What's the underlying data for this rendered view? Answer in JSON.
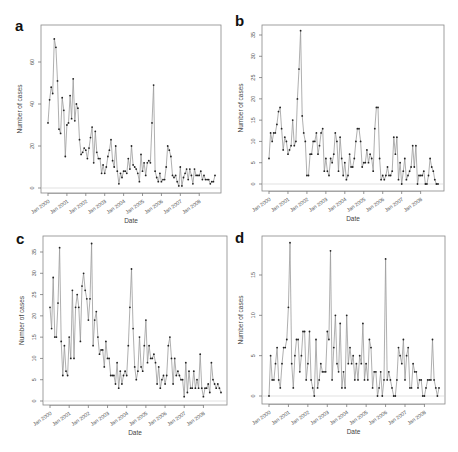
{
  "figure": {
    "panels": [
      "a",
      "b",
      "c",
      "d"
    ]
  },
  "chart_data": [
    {
      "panel": "a",
      "type": "line",
      "title": "",
      "xlabel": "Date",
      "ylabel": "Number of cases",
      "ylim": [
        0,
        75
      ],
      "yticks": [
        0,
        20,
        40,
        60
      ],
      "xticks": [
        "Jan 2000",
        "Jan 2001",
        "Jan 2002",
        "Jan 2003",
        "Jan 2004",
        "Jan 2005",
        "Jan 2006",
        "Jan 2007",
        "Jan 2008"
      ],
      "grid": false,
      "markers": true,
      "x_start": "Jan 2000",
      "frequency": "monthly",
      "values": [
        31,
        42,
        48,
        45,
        71,
        67,
        51,
        28,
        26,
        43,
        37,
        15,
        30,
        31,
        44,
        33,
        52,
        32,
        40,
        38,
        23,
        16,
        17,
        19,
        18,
        14,
        19,
        24,
        29,
        12,
        27,
        17,
        14,
        14,
        7,
        11,
        7,
        10,
        15,
        18,
        23,
        13,
        10,
        20,
        8,
        2,
        7,
        5,
        8,
        8,
        7,
        14,
        9,
        20,
        11,
        10,
        9,
        7,
        3,
        16,
        8,
        12,
        6,
        12,
        13,
        12,
        31,
        49,
        8,
        5,
        3,
        7,
        3,
        4,
        4,
        10,
        20,
        18,
        15,
        6,
        5,
        6,
        3,
        1,
        10,
        1,
        5,
        7,
        9,
        4,
        9,
        6,
        2,
        9,
        6,
        6,
        6,
        8,
        4,
        6,
        4,
        4,
        4,
        2,
        3,
        3,
        6
      ]
    },
    {
      "panel": "b",
      "type": "line",
      "title": "",
      "xlabel": "Date",
      "ylabel": "Number of cases",
      "ylim": [
        0,
        36
      ],
      "yticks": [
        0,
        5,
        10,
        15,
        20,
        25,
        30,
        35
      ],
      "xticks": [
        "Jan 2000",
        "Jan 2001",
        "Jan 2002",
        "Jan 2003",
        "Jan 2004",
        "Jan 2005",
        "Jan 2006",
        "Jan 2007",
        "Jan 2008"
      ],
      "grid": false,
      "markers": true,
      "x_start": "Jan 2000",
      "frequency": "monthly",
      "values": [
        6,
        12,
        10,
        12,
        12,
        14,
        17,
        18,
        13,
        8,
        11,
        10,
        7,
        8,
        9,
        15,
        9,
        10,
        20,
        27,
        36,
        16,
        12,
        10,
        2,
        2,
        7,
        7,
        10,
        10,
        12,
        7,
        9,
        12,
        13,
        3,
        6,
        3,
        2,
        6,
        5,
        7,
        12,
        10,
        3,
        11,
        6,
        2,
        5,
        1,
        2,
        7,
        4,
        4,
        6,
        10,
        13,
        13,
        10,
        4,
        5,
        5,
        8,
        5,
        7,
        6,
        3,
        13,
        18,
        18,
        6,
        1,
        2,
        1,
        2,
        4,
        2,
        2,
        3,
        11,
        7,
        11,
        1,
        5,
        0,
        3,
        6,
        1,
        2,
        3,
        4,
        9,
        4,
        9,
        0,
        2,
        2,
        2,
        3,
        0,
        0,
        2,
        6,
        4,
        3,
        1,
        0,
        0
      ]
    },
    {
      "panel": "c",
      "type": "line",
      "title": "",
      "xlabel": "Date",
      "ylabel": "Number of cases",
      "ylim": [
        0,
        37
      ],
      "yticks": [
        0,
        5,
        10,
        15,
        20,
        25,
        30,
        35
      ],
      "xticks": [
        "Jan 2000",
        "Jan 2001",
        "Jan 2002",
        "Jan 2003",
        "Jan 2004",
        "Jan 2005",
        "Jan 2006",
        "Jan 2007",
        "Jan 2008"
      ],
      "grid": false,
      "markers": true,
      "x_start": "Jan 2000",
      "frequency": "monthly",
      "values": [
        22,
        17,
        29,
        15,
        15,
        23,
        36,
        14,
        6,
        13,
        7,
        6,
        15,
        10,
        26,
        10,
        22,
        25,
        22,
        14,
        27,
        30,
        26,
        24,
        19,
        24,
        37,
        13,
        19,
        21,
        15,
        11,
        12,
        12,
        8,
        14,
        10,
        10,
        6,
        6,
        6,
        4,
        9,
        3,
        7,
        4,
        6,
        7,
        6,
        13,
        22,
        31,
        17,
        8,
        5,
        7,
        15,
        8,
        7,
        13,
        19,
        9,
        13,
        10,
        10,
        11,
        9,
        4,
        8,
        3,
        5,
        6,
        4,
        6,
        13,
        15,
        10,
        4,
        10,
        6,
        7,
        6,
        5,
        5,
        1,
        9,
        2,
        7,
        3,
        3,
        7,
        3,
        5,
        3,
        11,
        3,
        1,
        3,
        3,
        4,
        2,
        9,
        5,
        4,
        3,
        4,
        3,
        2
      ]
    },
    {
      "panel": "d",
      "type": "line",
      "title": "",
      "xlabel": "Date",
      "ylabel": "Number of cases",
      "ylim": [
        0,
        19
      ],
      "yticks": [
        0,
        5,
        10,
        15
      ],
      "xticks": [
        "Jan 2000",
        "Jan 2001",
        "Jan 2002",
        "Jan 2003",
        "Jan 2004",
        "Jan 2005",
        "Jan 2006",
        "Jan 2007",
        "Jan 2008"
      ],
      "grid": false,
      "markers": true,
      "x_start": "Jan 2000",
      "frequency": "monthly",
      "values": [
        0,
        5,
        2,
        2,
        4,
        6,
        2,
        1,
        4,
        6,
        6,
        7,
        11,
        19,
        4,
        1,
        5,
        7,
        7,
        3,
        5,
        8,
        8,
        2,
        4,
        8,
        2,
        1,
        0,
        7,
        1,
        2,
        4,
        3,
        3,
        3,
        8,
        7,
        18,
        2,
        6,
        10,
        4,
        3,
        9,
        1,
        3,
        1,
        10,
        4,
        6,
        4,
        5,
        2,
        4,
        2,
        5,
        4,
        9,
        2,
        4,
        2,
        7,
        6,
        1,
        3,
        3,
        0,
        1,
        3,
        0,
        2,
        17,
        2,
        3,
        2,
        1,
        0,
        0,
        2,
        6,
        5,
        4,
        7,
        2,
        5,
        6,
        1,
        1,
        4,
        3,
        3,
        1,
        2,
        2,
        0,
        0,
        1,
        2,
        2,
        2,
        7,
        2,
        1,
        0,
        1
      ]
    }
  ]
}
